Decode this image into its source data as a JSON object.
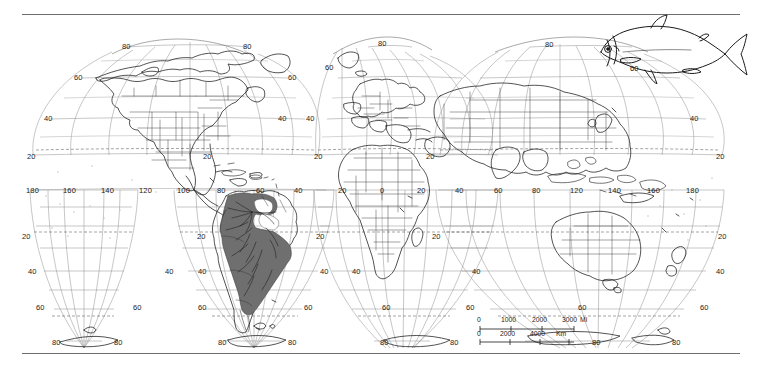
{
  "figure": {
    "type": "world-distribution-map",
    "projection": "Goode homolosine interrupted",
    "line_color": "#1a1a1a",
    "graticule_color": "#8a8a8a",
    "shade_color": "#6b6b6b",
    "rule_color": "#6e6e6e",
    "background": "#ffffff"
  },
  "inset": {
    "fish_label": "characin-fish-drawing",
    "outline_color": "#1a1a1a"
  },
  "graticule": {
    "longitude_label_values": [
      "180",
      "160",
      "140",
      "120",
      "100",
      "80",
      "60",
      "40",
      "20",
      "0",
      "20",
      "40",
      "60",
      "80",
      "100",
      "120",
      "140",
      "160",
      "180"
    ],
    "latitude_label_values": [
      "80",
      "60",
      "40",
      "20",
      "0",
      "20",
      "40",
      "60",
      "80"
    ],
    "equator_label": "0",
    "interval_degrees": 20
  },
  "longitude_labels": [
    {
      "t": "180",
      "x": 26,
      "y": 186
    },
    {
      "t": "160",
      "x": 63,
      "y": 186
    },
    {
      "t": "140",
      "x": 101,
      "y": 186
    },
    {
      "t": "120",
      "x": 139,
      "y": 186
    },
    {
      "t": "100",
      "x": 177,
      "y": 186
    },
    {
      "t": "80",
      "x": 217,
      "y": 186
    },
    {
      "t": "60",
      "x": 256,
      "y": 186
    },
    {
      "t": "40",
      "x": 294,
      "y": 186
    },
    {
      "t": "20",
      "x": 338,
      "y": 186
    },
    {
      "t": "0",
      "x": 380,
      "y": 186
    },
    {
      "t": "20",
      "x": 417,
      "y": 186
    },
    {
      "t": "40",
      "x": 455,
      "y": 186
    },
    {
      "t": "60",
      "x": 494,
      "y": 186
    },
    {
      "t": "80",
      "x": 532,
      "y": 186
    },
    {
      "t": "120",
      "x": 570,
      "y": 186
    },
    {
      "t": "140",
      "x": 608,
      "y": 186
    },
    {
      "t": "160",
      "x": 647,
      "y": 186
    },
    {
      "t": "180",
      "x": 686,
      "y": 186
    }
  ],
  "latitude_labels": [
    {
      "t": "80",
      "x": 122,
      "y": 49
    },
    {
      "t": "80",
      "x": 243,
      "y": 49
    },
    {
      "t": "80",
      "x": 378,
      "y": 41
    },
    {
      "t": "80",
      "x": 545,
      "y": 42
    },
    {
      "t": "60",
      "x": 84,
      "y": 78
    },
    {
      "t": "60",
      "x": 285,
      "y": 78
    },
    {
      "t": "60",
      "x": 327,
      "y": 67
    },
    {
      "t": "60",
      "x": 628,
      "y": 68
    },
    {
      "t": "40",
      "x": 54,
      "y": 118
    },
    {
      "t": "40",
      "x": 275,
      "y": 118
    },
    {
      "t": "40",
      "x": 307,
      "y": 118
    },
    {
      "t": "40",
      "x": 689,
      "y": 118
    },
    {
      "t": "20",
      "x": 35,
      "y": 157
    },
    {
      "t": "20",
      "x": 200,
      "y": 157
    },
    {
      "t": "20",
      "x": 313,
      "y": 156
    },
    {
      "t": "20",
      "x": 424,
      "y": 157
    },
    {
      "t": "20",
      "x": 716,
      "y": 157
    },
    {
      "t": "20",
      "x": 30,
      "y": 236
    },
    {
      "t": "20",
      "x": 196,
      "y": 236
    },
    {
      "t": "20",
      "x": 314,
      "y": 236
    },
    {
      "t": "20",
      "x": 430,
      "y": 236
    },
    {
      "t": "20",
      "x": 718,
      "y": 236
    },
    {
      "t": "40",
      "x": 36,
      "y": 271
    },
    {
      "t": "40",
      "x": 167,
      "y": 271
    },
    {
      "t": "40",
      "x": 200,
      "y": 271
    },
    {
      "t": "40",
      "x": 318,
      "y": 271
    },
    {
      "t": "40",
      "x": 352,
      "y": 271
    },
    {
      "t": "40",
      "x": 470,
      "y": 271
    },
    {
      "t": "40",
      "x": 716,
      "y": 271
    },
    {
      "t": "60",
      "x": 44,
      "y": 309
    },
    {
      "t": "60",
      "x": 143,
      "y": 309
    },
    {
      "t": "60",
      "x": 206,
      "y": 309
    },
    {
      "t": "60",
      "x": 313,
      "y": 309
    },
    {
      "t": "60",
      "x": 390,
      "y": 309
    },
    {
      "t": "60",
      "x": 473,
      "y": 309
    },
    {
      "t": "60",
      "x": 575,
      "y": 309
    },
    {
      "t": "60",
      "x": 700,
      "y": 309
    },
    {
      "t": "80",
      "x": 60,
      "y": 343
    },
    {
      "t": "80",
      "x": 118,
      "y": 343
    },
    {
      "t": "80",
      "x": 234,
      "y": 343
    },
    {
      "t": "80",
      "x": 300,
      "y": 343
    },
    {
      "t": "80",
      "x": 388,
      "y": 343
    },
    {
      "t": "80",
      "x": 458,
      "y": 343
    },
    {
      "t": "80",
      "x": 600,
      "y": 343
    },
    {
      "t": "80",
      "x": 675,
      "y": 343
    }
  ],
  "scalebar": {
    "miles": {
      "ticks": [
        "0",
        "1000",
        "2000",
        "3000"
      ],
      "unit": "Mi"
    },
    "km": {
      "ticks": [
        "0",
        "2000",
        "4000"
      ],
      "unit": "Km"
    }
  }
}
